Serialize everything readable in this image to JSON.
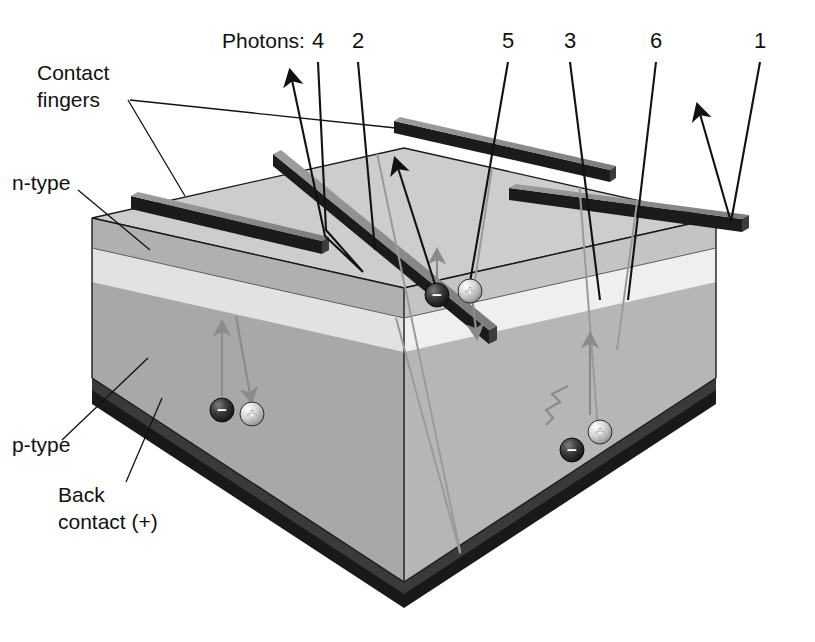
{
  "figure": {
    "kind": "solar-cell-cross-section-diagram",
    "title_text": "",
    "background_color": "#ffffff"
  },
  "labels": {
    "photons_prefix": "Photons:",
    "contact_fingers_line1": "Contact",
    "contact_fingers_line2": "fingers",
    "n_type": "n-type",
    "p_type": "p-type",
    "back_contact_line1": "Back",
    "back_contact_line2": "contact (+)"
  },
  "photon_numbers": [
    {
      "id": "photon-4",
      "text": "4",
      "x": 318,
      "y": 48
    },
    {
      "id": "photon-2",
      "text": "2",
      "x": 358,
      "y": 48
    },
    {
      "id": "photon-5",
      "text": "5",
      "x": 508,
      "y": 48
    },
    {
      "id": "photon-3",
      "text": "3",
      "x": 570,
      "y": 48
    },
    {
      "id": "photon-6",
      "text": "6",
      "x": 656,
      "y": 48
    },
    {
      "id": "photon-1",
      "text": "1",
      "x": 760,
      "y": 48
    }
  ],
  "carriers": [
    {
      "id": "electron-top",
      "glyph": "−",
      "cx": 437,
      "cy": 295,
      "kind": "electron"
    },
    {
      "id": "hole-top",
      "glyph": "+",
      "cx": 470,
      "cy": 291,
      "kind": "hole"
    },
    {
      "id": "electron-left",
      "glyph": "−",
      "cx": 222,
      "cy": 410,
      "kind": "electron"
    },
    {
      "id": "hole-left",
      "glyph": "+",
      "cx": 252,
      "cy": 414,
      "kind": "hole"
    },
    {
      "id": "electron-right",
      "glyph": "−",
      "cx": 572,
      "cy": 450,
      "kind": "electron"
    },
    {
      "id": "hole-right",
      "glyph": "+",
      "cx": 600,
      "cy": 432,
      "kind": "hole"
    }
  ],
  "colors": {
    "background": "#ffffff",
    "top_face": "#cdcdcd",
    "left_face_ntype": "#b0b0b0",
    "left_face_depletion": "#e2e2e2",
    "left_face_ptype": "#a8a8a8",
    "right_face_ntype": "#c4c4c4",
    "right_face_depletion": "#efefef",
    "right_face_ptype": "#b6b6b6",
    "finger_top": "#8d8d8d",
    "finger_side": "#1b1b1b",
    "back_contact": "#191919",
    "back_contact_edge": "#3a3a3a",
    "line_ink": "#111111",
    "carrier_arrow": "#8b8b8b",
    "electron_fill": "#2b2b2b",
    "hole_fill": "#cfcfcf"
  },
  "fingers": [
    {
      "id": "finger-front-left"
    },
    {
      "id": "finger-middle"
    },
    {
      "id": "finger-back-right"
    },
    {
      "id": "finger-far-right"
    }
  ],
  "caption": {
    "cut_off_text": ""
  }
}
